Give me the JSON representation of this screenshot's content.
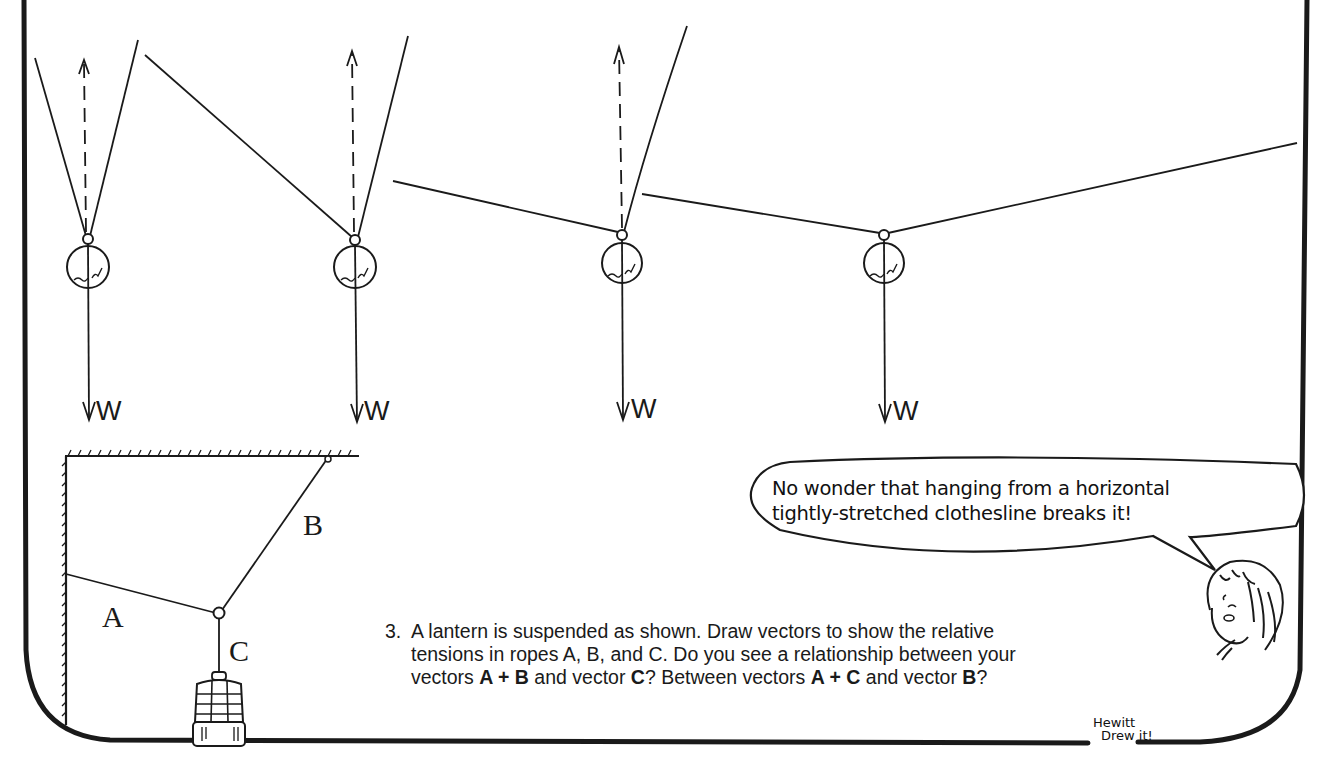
{
  "figure": {
    "labels": {
      "weight": "W",
      "rope_a": "A",
      "rope_b": "B",
      "rope_c": "C"
    },
    "hanging_balls": [
      {
        "id": 1,
        "description": "two steep ropes, nearly vertical",
        "weight_label": "W"
      },
      {
        "id": 2,
        "description": "one shallow rope left, steep rope right",
        "weight_label": "W"
      },
      {
        "id": 3,
        "description": "nearly horizontal left rope, steep right rope",
        "weight_label": "W"
      },
      {
        "id": 4,
        "description": "two nearly horizontal ropes (clothesline)",
        "weight_label": "W"
      }
    ]
  },
  "speech_bubble": {
    "line1": "No wonder that hanging from a horizontal",
    "line2": "tightly-stretched clothesline breaks it!"
  },
  "question": {
    "number": "3.",
    "line1": "A lantern is suspended as shown.  Draw vectors to show the relative",
    "line2": "tensions in ropes A, B, and C.  Do you see a relationship between your",
    "line3_pre": "vectors ",
    "line3_ab": "A + B",
    "line3_mid": " and vector ",
    "line3_c": "C",
    "line3_mid2": "?   Between vectors ",
    "line3_ac": "A + C",
    "line3_mid3": " and vector ",
    "line3_b": "B",
    "line3_end": "?"
  },
  "signature": {
    "line1": "Hewitt",
    "line2": "Drew it!"
  },
  "colors": {
    "ink": "#1a1a1a",
    "paper": "#ffffff"
  }
}
